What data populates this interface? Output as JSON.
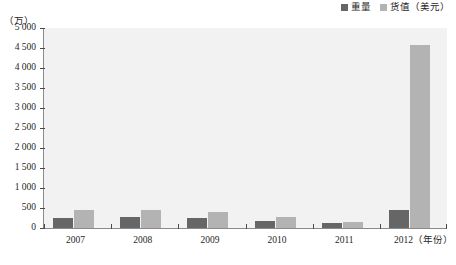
{
  "legend": {
    "position": "top-right",
    "entries": [
      {
        "label": "重量",
        "color": "#666666",
        "swatch_name": "legend-swatch-weight"
      },
      {
        "label": "货值（美元）",
        "color": "#b3b3b3",
        "swatch_name": "legend-swatch-value"
      }
    ]
  },
  "axes": {
    "y_unit_label": "（万）",
    "y_tick_labels": [
      "5 000",
      "4 500",
      "4 000",
      "3 500",
      "3 000",
      "2 500",
      "2 000",
      "1 500",
      "1 000",
      "500",
      "0"
    ],
    "y_tick_values": [
      5000,
      4500,
      4000,
      3500,
      3000,
      2500,
      2000,
      1500,
      1000,
      500,
      0
    ],
    "x_unit_label": "（年份）",
    "x_tick_labels": [
      "2007",
      "2008",
      "2009",
      "2010",
      "2011",
      "2012"
    ]
  },
  "chart_data": {
    "type": "bar",
    "title": "",
    "subtitle": "",
    "xlabel": "（年份）",
    "ylabel": "（万）",
    "ylim": [
      0,
      5000
    ],
    "ytick_step": 500,
    "grid": false,
    "legend_position": "top-right",
    "categories": [
      "2007",
      "2008",
      "2009",
      "2010",
      "2011",
      "2012"
    ],
    "series": [
      {
        "name": "重量",
        "color": "#666666",
        "values": [
          255,
          265,
          240,
          180,
          120,
          440
        ]
      },
      {
        "name": "货值（美元）",
        "color": "#b3b3b3",
        "values": [
          455,
          460,
          400,
          280,
          160,
          4580
        ]
      }
    ]
  },
  "colors": {
    "plot_background": "#f2f2f2",
    "axis_line": "#8a8a8a",
    "text": "#262626",
    "series_weight": "#666666",
    "series_value": "#b3b3b3"
  }
}
